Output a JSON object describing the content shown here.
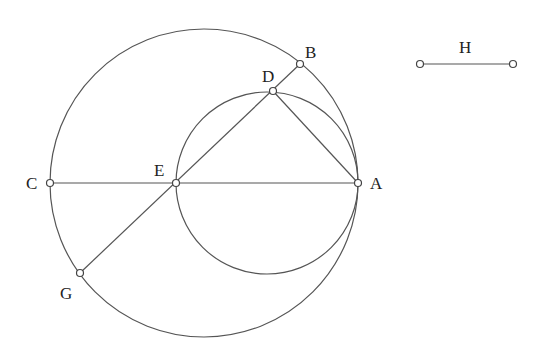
{
  "diagram": {
    "type": "geometric construction",
    "circles": [
      {
        "name": "outer-circle",
        "cx": 204,
        "cy": 183,
        "r": 154
      },
      {
        "name": "inner-circle",
        "cx": 267,
        "cy": 183,
        "r": 91
      }
    ],
    "points": {
      "A": {
        "x": 358,
        "y": 183,
        "label": "A",
        "lx": 370,
        "ly": 189
      },
      "B": {
        "x": 300,
        "y": 64,
        "label": "B",
        "lx": 305,
        "ly": 58
      },
      "C": {
        "x": 50,
        "y": 183,
        "label": "C",
        "lx": 26,
        "ly": 189
      },
      "D": {
        "x": 273,
        "y": 91,
        "label": "D",
        "lx": 262,
        "ly": 82
      },
      "E": {
        "x": 176,
        "y": 183,
        "label": "E",
        "lx": 154,
        "ly": 176
      },
      "G": {
        "x": 80,
        "y": 273,
        "label": "G",
        "lx": 60,
        "ly": 299
      },
      "H1": {
        "x": 420,
        "y": 64
      },
      "H2": {
        "x": 513,
        "y": 64
      }
    },
    "segments": [
      {
        "name": "segment-CA",
        "from": "C",
        "to": "A"
      },
      {
        "name": "segment-GB",
        "from": "G",
        "to": "B"
      },
      {
        "name": "segment-DA",
        "from": "D",
        "to": "A"
      },
      {
        "name": "segment-H",
        "from": "H1",
        "to": "H2"
      }
    ],
    "labels": {
      "A": "A",
      "B": "B",
      "C": "C",
      "D": "D",
      "E": "E",
      "G": "G",
      "H": "H"
    },
    "h_label_pos": {
      "x": 459,
      "y": 53
    },
    "colors": {
      "stroke": "#555555",
      "background": "#ffffff"
    }
  }
}
